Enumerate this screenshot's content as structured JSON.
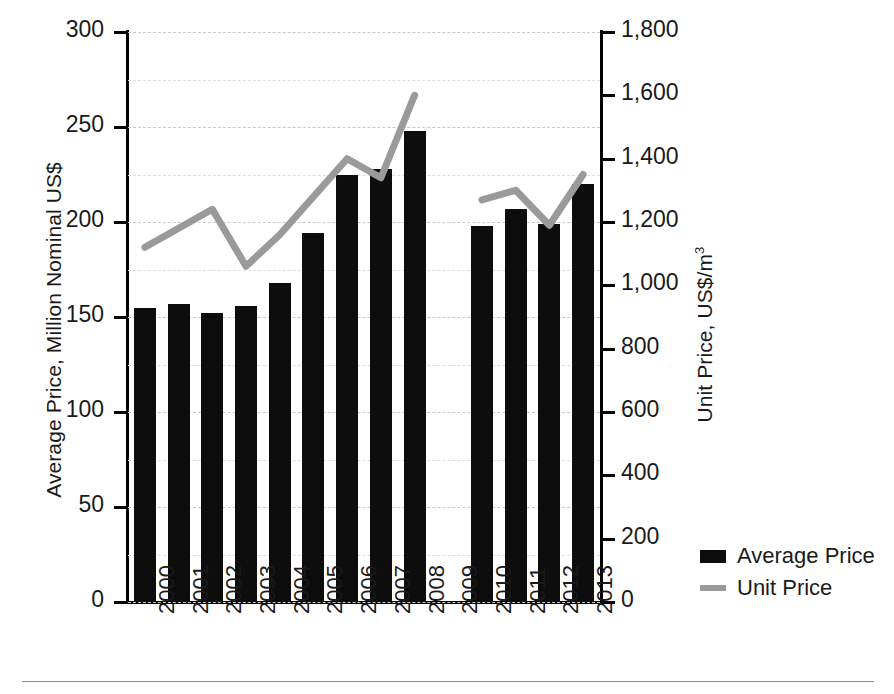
{
  "chart_data": {
    "type": "bar",
    "title": "",
    "subtitle": "",
    "xlabel": "",
    "ylabel": "Average Price, Million Nominal US$",
    "ylabel_secondary": "Unit Price, US$/m",
    "ylabel_secondary_exponent": "3",
    "categories": [
      "2000",
      "2001",
      "2002",
      "2003",
      "2004",
      "2005",
      "2006",
      "2007",
      "2008",
      "2009",
      "2010",
      "2011",
      "2012",
      "2013"
    ],
    "ylim": [
      0,
      300
    ],
    "ylim_secondary": [
      0,
      1800
    ],
    "yticks": [
      "0",
      "50",
      "100",
      "150",
      "200",
      "250",
      "300"
    ],
    "ytick_values": [
      0,
      50,
      100,
      150,
      200,
      250,
      300
    ],
    "yticks_secondary": [
      "0",
      "200",
      "400",
      "600",
      "800",
      "1,000",
      "1,200",
      "1,400",
      "1,600",
      "1,800"
    ],
    "ytick_values_secondary": [
      0,
      200,
      400,
      600,
      800,
      1000,
      1200,
      1400,
      1600,
      1800
    ],
    "grid": true,
    "legend_position": "right-bottom",
    "series": [
      {
        "name": "Average Price",
        "kind": "bar",
        "axis": "left",
        "color": "#0d0d0d",
        "values": [
          155,
          157,
          152,
          156,
          168,
          194,
          225,
          228,
          248,
          null,
          198,
          207,
          199,
          220
        ]
      },
      {
        "name": "Unit Price",
        "kind": "line",
        "axis": "right",
        "color": "#9a9a9a",
        "values": [
          1120,
          1180,
          1240,
          1060,
          1160,
          1280,
          1400,
          1340,
          1600,
          null,
          1270,
          1300,
          1190,
          1350
        ]
      }
    ]
  },
  "legend": {
    "items": [
      {
        "label": "Average Price",
        "type": "bar",
        "color": "#0d0d0d"
      },
      {
        "label": "Unit Price",
        "type": "line",
        "color": "#9a9a9a"
      }
    ]
  }
}
